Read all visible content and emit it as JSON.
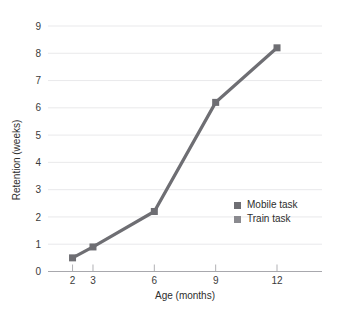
{
  "chart_data": {
    "type": "line",
    "title": "",
    "subtitle": "",
    "xlabel": "Age (months)",
    "ylabel": "Retention (weeks)",
    "x": [
      2,
      3,
      6,
      9,
      12
    ],
    "xtick_labels": [
      "2",
      "3",
      "6",
      "9",
      "12"
    ],
    "ytick_labels": [
      "0",
      "1",
      "2",
      "3",
      "4",
      "5",
      "6",
      "7",
      "8",
      "9"
    ],
    "xlim": [
      0.8,
      14.2
    ],
    "ylim": [
      0,
      9
    ],
    "grid": "horizontal",
    "legend_position": "center-right",
    "series": [
      {
        "name": "Mobile task",
        "color": "#6e6e73",
        "values": [
          0.5,
          0.9,
          2.2,
          null,
          null
        ]
      },
      {
        "name": "Train task",
        "color": "#6e6e73",
        "values": [
          null,
          null,
          2.2,
          6.2,
          8.2
        ]
      }
    ],
    "points": [
      {
        "x": 2,
        "y": 0.5
      },
      {
        "x": 3,
        "y": 0.9
      },
      {
        "x": 6,
        "y": 2.2
      },
      {
        "x": 9,
        "y": 6.2
      },
      {
        "x": 12,
        "y": 8.2
      }
    ],
    "annotations": []
  },
  "legend": {
    "entries": [
      {
        "label": "Mobile task",
        "swatch": "#6e6e73"
      },
      {
        "label": "Train task",
        "swatch": "#8a8a8f"
      }
    ]
  },
  "axes": {
    "x_title": "Age (months)",
    "y_title": "Retention (weeks)",
    "x_ticks": [
      "2",
      "3",
      "6",
      "9",
      "12"
    ],
    "y_ticks": [
      "9",
      "8",
      "7",
      "6",
      "5",
      "4",
      "3",
      "2",
      "1",
      "0"
    ]
  },
  "colors": {
    "line": "#6e6e73",
    "marker": "#6e6e73",
    "gridline": "#e3e3e6",
    "axis": "#a8a8ad",
    "text": "#2e2e2e",
    "background": "#ffffff"
  }
}
